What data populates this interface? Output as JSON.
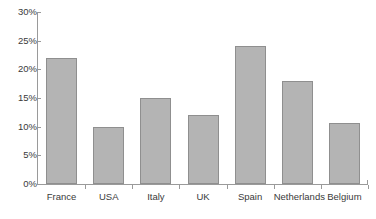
{
  "chart_data": {
    "type": "bar",
    "title": "",
    "subtitle": "",
    "xlabel": "",
    "ylabel": "",
    "categories": [
      "France",
      "USA",
      "Italy",
      "UK",
      "Spain",
      "Netherlands",
      "Belgium"
    ],
    "values": [
      22,
      10,
      15,
      12,
      24,
      18,
      10.7
    ],
    "value_labels": [
      "22%",
      "10%",
      "15%",
      "12%",
      "24%",
      "18%",
      "10.7%"
    ],
    "ylim": [
      0,
      30
    ],
    "y_ticks": [
      0,
      5,
      10,
      15,
      20,
      25,
      30
    ],
    "y_tick_labels": [
      "0%",
      "5%",
      "10%",
      "15%",
      "20%",
      "25%",
      "30%"
    ],
    "grid": false,
    "legend": null,
    "legend_position": "none",
    "series": [
      {
        "name": "",
        "values": [
          22,
          10,
          15,
          12,
          24,
          18,
          10.7
        ],
        "color": "#b4b4b4",
        "border_color": "#8f8f8f"
      }
    ],
    "colors": {
      "bar_fill": "#b4b4b4",
      "bar_border": "#8f8f8f",
      "axis": "#9a9a9a",
      "text": "#3a3a3a",
      "background": "#ffffff"
    }
  }
}
